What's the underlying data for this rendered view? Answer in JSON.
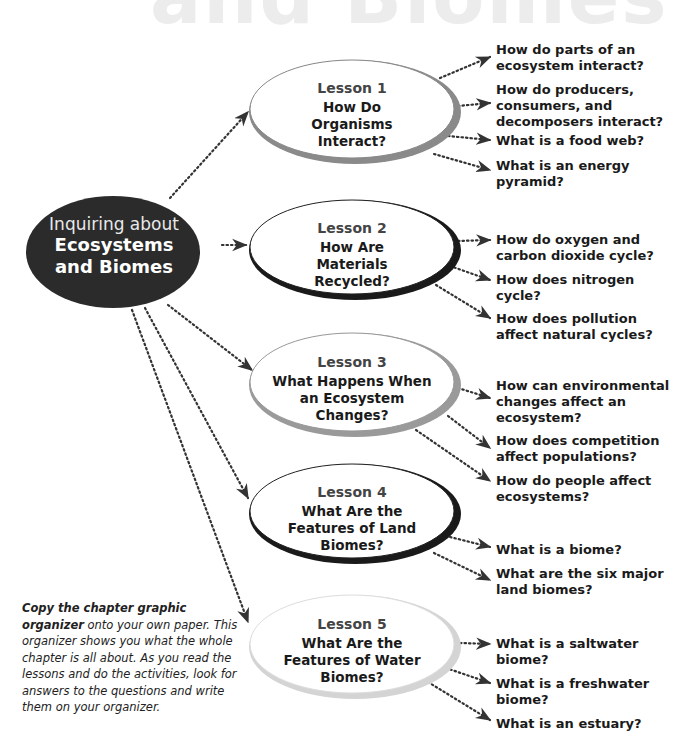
{
  "header": {
    "ghost_title": "and Biomes"
  },
  "center": {
    "line1": "Inquiring about",
    "line2": "Ecosystems",
    "line3": "and Biomes"
  },
  "lessons": [
    {
      "title": "Lesson 1",
      "question": "How Do Organisms Interact?",
      "subquestions": [
        "How do parts of an ecosystem interact?",
        "How do producers, consumers, and decomposers interact?",
        "What is a food web?",
        "What is an energy pyramid?"
      ]
    },
    {
      "title": "Lesson 2",
      "question": "How Are Materials Recycled?",
      "subquestions": [
        "How do oxygen and carbon dioxide cycle?",
        "How does nitrogen cycle?",
        "How does pollution affect natural cycles?"
      ]
    },
    {
      "title": "Lesson 3",
      "question": "What Happens When an Ecosystem Changes?",
      "subquestions": [
        "How can environmental changes affect an ecosystem?",
        "How does competition affect populations?",
        "How do people affect ecosystems?"
      ]
    },
    {
      "title": "Lesson 4",
      "question": "What Are the Features of Land Biomes?",
      "subquestions": [
        "What is a biome?",
        "What are the six major land biomes?"
      ]
    },
    {
      "title": "Lesson 5",
      "question": "What Are the Features of Water Biomes?",
      "subquestions": [
        "What is a saltwater biome?",
        "What is a freshwater biome?",
        "What is an estuary?"
      ]
    }
  ],
  "note": {
    "bold": "Copy the chapter graphic organizer",
    "rest": " onto your own paper. This organizer shows you what the whole chapter is all about. As you read the lessons and do the activities, look for answers to the questions and write them on your organizer."
  },
  "colors": {
    "center_fill": "#2b2b2b",
    "lesson1_shade": "#8a8a8a",
    "lesson2_shade": "#1a1a1a",
    "lesson3_shade": "#9a9a9a",
    "lesson4_shade": "#1a1a1a",
    "lesson5_shade": "#d4d4d4"
  }
}
